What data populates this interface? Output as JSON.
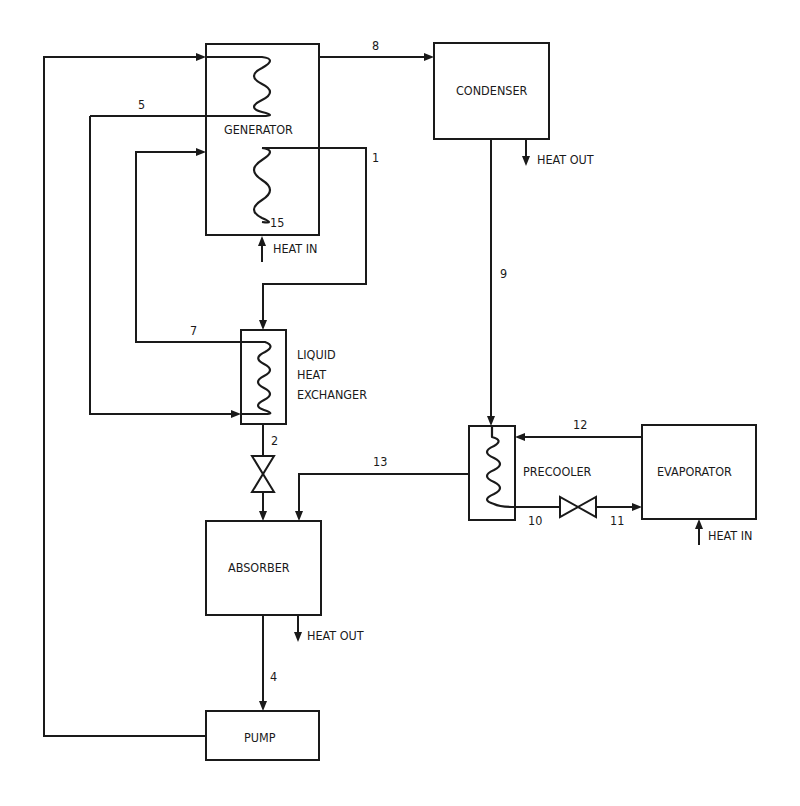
{
  "diagram": {
    "type": "absorption-refrigeration-cycle",
    "components": [
      {
        "id": "generator",
        "label": "GENERATOR"
      },
      {
        "id": "condenser",
        "label": "CONDENSER"
      },
      {
        "id": "liquid-heat-exchanger",
        "label_lines": [
          "LIQUID",
          "HEAT",
          "EXCHANGER"
        ]
      },
      {
        "id": "precooler",
        "label": "PRECOOLER"
      },
      {
        "id": "evaporator",
        "label": "EVAPORATOR"
      },
      {
        "id": "absorber",
        "label": "ABSORBER"
      },
      {
        "id": "pump",
        "label": "PUMP"
      }
    ],
    "heat_labels": {
      "generator": "HEAT IN",
      "condenser": "HEAT OUT",
      "evaporator": "HEAT IN",
      "absorber": "HEAT OUT"
    },
    "state_points": {
      "p1": "1",
      "p2": "2",
      "p4": "4",
      "p5": "5",
      "p7": "7",
      "p8": "8",
      "p9": "9",
      "p10": "10",
      "p11": "11",
      "p12": "12",
      "p13": "13",
      "p15": "15"
    },
    "stroke_color": "#1a1a1a",
    "background": "#ffffff"
  }
}
